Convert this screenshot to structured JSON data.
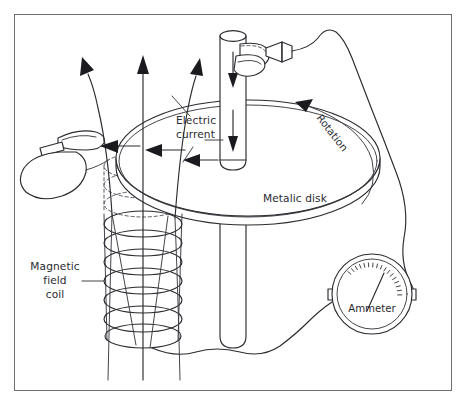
{
  "figure": {
    "background_color": "#ffffff",
    "border_color": "#6e6e72",
    "ink_color": "#2b2b30",
    "width": 467,
    "height": 406
  },
  "labels": {
    "electric_current": {
      "line1": "Electric",
      "line2": "current"
    },
    "magnetic_field_coil": {
      "line1": "Magnetic",
      "line2": "field",
      "line3": "coil"
    },
    "metalic_disk": "Metalic disk",
    "rotation": "Rotation",
    "ammeter": "Ammeter"
  },
  "components": {
    "disk": {
      "name": "Metalic disk",
      "center_x": 248,
      "center_y": 158,
      "radius_x": 132,
      "radius_y": 58,
      "thickness": 9
    },
    "shaft": {
      "name": "vertical drive shaft",
      "center_x": 233,
      "top_y": 28,
      "bottom_y": 348,
      "half_width": 13
    },
    "coil": {
      "name": "Magnetic field coil",
      "center_x": 143,
      "radius_x": 39,
      "radius_y": 13,
      "visible_turns": 7,
      "hidden_turns": 4,
      "top_y": 164,
      "turn_spacing": 19
    },
    "ammeter": {
      "name": "Ammeter",
      "center_x": 372,
      "center_y": 294,
      "outer_radius": 40,
      "inner_radius": 35,
      "tick_count": 17,
      "needle_angle_deg": -62
    },
    "field_arrows": [
      {
        "name": "left-field-line",
        "curved": true
      },
      {
        "name": "center-field-line",
        "curved": false
      },
      {
        "name": "right-field-line",
        "curved": true
      }
    ],
    "current_arrows": [
      {
        "name": "current-arrow-upper"
      },
      {
        "name": "current-arrow-middle"
      },
      {
        "name": "current-arrow-lower"
      }
    ],
    "shaft_arrows": [
      {
        "name": "shaft-arrow-upper"
      },
      {
        "name": "shaft-arrow-lower"
      }
    ],
    "brushes": [
      {
        "name": "top-slip-ring-brush"
      },
      {
        "name": "left-rim-brush"
      }
    ],
    "wires": [
      {
        "name": "wire-top-brush-to-ammeter-right"
      },
      {
        "name": "wire-coil-to-ammeter-left"
      },
      {
        "name": "wire-left-brush-loop"
      }
    ]
  }
}
